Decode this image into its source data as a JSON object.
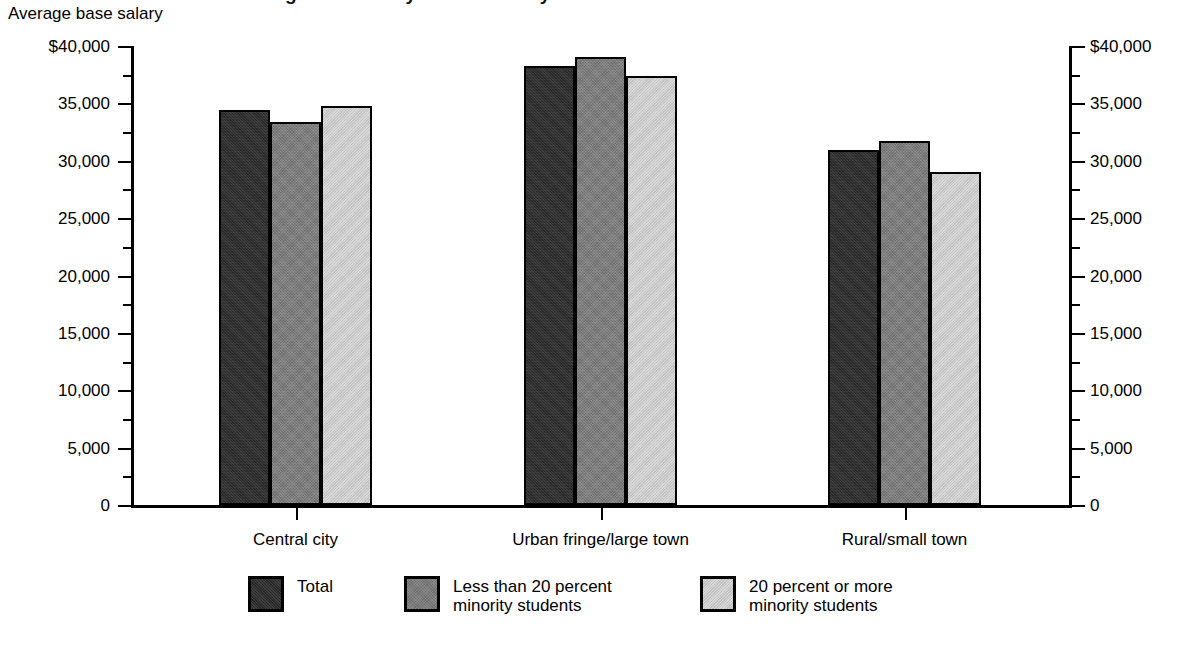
{
  "figure": {
    "cut_off_title": "Average base salary of teachers by school location",
    "subtitle": "Average base salary"
  },
  "chart_data": {
    "type": "bar",
    "title": "Average base salary of teachers by school location",
    "subtitle": "Average base salary",
    "xlabel": "",
    "ylabel": "Average base salary",
    "ylim": [
      0,
      40000
    ],
    "ytick_step": 5000,
    "yminor_step": 2500,
    "grid": false,
    "legend_position": "bottom",
    "dual_y_axis": true,
    "categories": [
      "Central city",
      "Urban fringe/large town",
      "Rural/small town"
    ],
    "ytick_labels": [
      "$40,000",
      "35,000",
      "30,000",
      "25,000",
      "20,000",
      "15,000",
      "10,000",
      "5,000",
      "0"
    ],
    "ytick_values": [
      40000,
      35000,
      30000,
      25000,
      20000,
      15000,
      10000,
      5000,
      0
    ],
    "series": [
      {
        "name": "Total",
        "color": "#2b2b2b",
        "values": [
          34400,
          38300,
          30900
        ]
      },
      {
        "name": "Less than 20 percent\nminority students",
        "color": "#7c7c7c",
        "values": [
          33400,
          39000,
          31700
        ]
      },
      {
        "name": "20 percent or more\nminority students",
        "color": "#d6d6d6",
        "values": [
          34800,
          37400,
          29000
        ]
      }
    ]
  }
}
